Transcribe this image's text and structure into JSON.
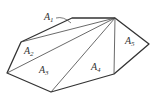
{
  "diagram": {
    "vertices": {
      "P": [
        115,
        18
      ],
      "Q": [
        72,
        18
      ],
      "R": [
        21,
        42
      ],
      "S": [
        7,
        73
      ],
      "T": [
        51,
        92
      ],
      "U": [
        114,
        74
      ],
      "V": [
        149,
        44
      ]
    },
    "outline_order": [
      "P",
      "Q",
      "R",
      "S",
      "T",
      "U",
      "V"
    ],
    "diagonals": [
      [
        "P",
        "R"
      ],
      [
        "P",
        "S"
      ],
      [
        "P",
        "T"
      ],
      [
        "P",
        "U"
      ]
    ],
    "labels": [
      {
        "id": "A1",
        "letter": "A",
        "sub": "1",
        "x": 44,
        "y": 20
      },
      {
        "id": "A2",
        "letter": "A",
        "sub": "2",
        "x": 24,
        "y": 54
      },
      {
        "id": "A3",
        "letter": "A",
        "sub": "3",
        "x": 39,
        "y": 73
      },
      {
        "id": "A4",
        "letter": "A",
        "sub": "4",
        "x": 91,
        "y": 70
      },
      {
        "id": "A5",
        "letter": "A",
        "sub": "5",
        "x": 125,
        "y": 44
      }
    ],
    "a1_leader": {
      "from": [
        56,
        18
      ],
      "to": [
        71,
        23
      ]
    }
  }
}
